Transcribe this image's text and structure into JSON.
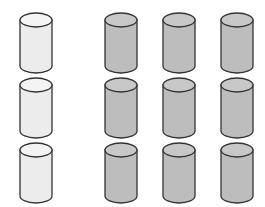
{
  "diagram": {
    "colors": {
      "light_fill": "#ececec",
      "light_top": "#f4f4f4",
      "gray_fill": "#bdbdbd",
      "gray_top": "#c8c8c8",
      "stroke": "#333333",
      "background": "#ffffff"
    },
    "rows": 3,
    "columns": [
      {
        "x": 36,
        "type": "light"
      },
      {
        "x": 121,
        "type": "gray"
      },
      {
        "x": 179,
        "type": "gray"
      },
      {
        "x": 237,
        "type": "gray"
      }
    ],
    "row_tops": [
      20,
      85,
      150
    ],
    "cylinder": {
      "rx": 16,
      "ry": 7,
      "height": 46
    }
  }
}
